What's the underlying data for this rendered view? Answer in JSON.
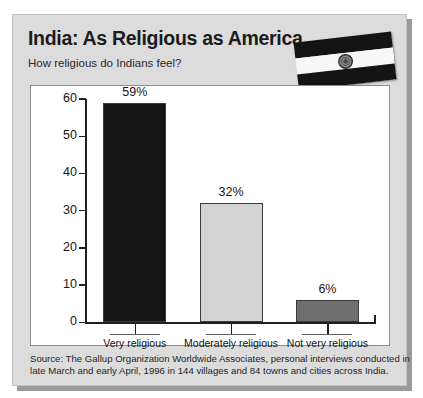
{
  "card": {
    "title": "India: As Religious as America",
    "subtitle": "How religious do Indians feel?"
  },
  "flag": {
    "name": "india-flag",
    "bands": [
      "saffron",
      "white",
      "green"
    ],
    "emblem": "ashoka-chakra"
  },
  "source": {
    "line1": "Source: The Gallup Organization Worldwide Associates, personal interviews conducted in",
    "line2": "late March and early April, 1996 in 144 villages and 84 towns and cities across India."
  },
  "chart_data": {
    "type": "bar",
    "title": "India: As Religious as America",
    "subtitle": "How religious do Indians feel?",
    "xlabel": "",
    "ylabel": "",
    "ylim": [
      0,
      60
    ],
    "yticks": [
      0,
      10,
      20,
      30,
      40,
      50,
      60
    ],
    "grid": false,
    "legend": "none",
    "categories": [
      "Very religious",
      "Moderately religious",
      "Not very religious"
    ],
    "values": [
      59,
      32,
      6
    ],
    "data_labels": [
      "59%",
      "32%",
      "6%"
    ],
    "colors": [
      "#151515",
      "#d4d4d4",
      "#6f6f6f"
    ]
  }
}
